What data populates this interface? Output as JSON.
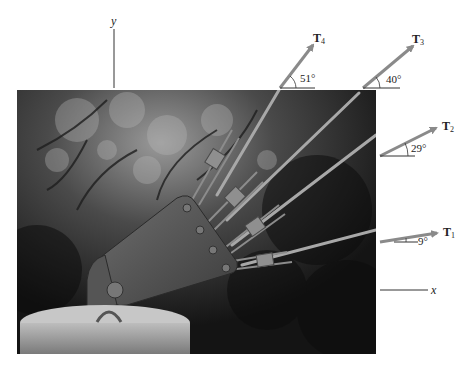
{
  "figure": {
    "axes": {
      "x_label": "x",
      "y_label": "y"
    },
    "forces": [
      {
        "name": "T",
        "subscript": "1",
        "angle_label": "9°",
        "angle_deg": 9
      },
      {
        "name": "T",
        "subscript": "2",
        "angle_label": "29°",
        "angle_deg": 29
      },
      {
        "name": "T",
        "subscript": "3",
        "angle_label": "40°",
        "angle_deg": 40
      },
      {
        "name": "T",
        "subscript": "4",
        "angle_label": "51°",
        "angle_deg": 51
      }
    ],
    "photo": {
      "description": "Steel gusset plate anchor on concrete pier with four cable tendons fanning out, trees in background"
    },
    "colors": {
      "arrow": "#8a8a8a",
      "line": "#333333",
      "text": "#222222"
    }
  }
}
